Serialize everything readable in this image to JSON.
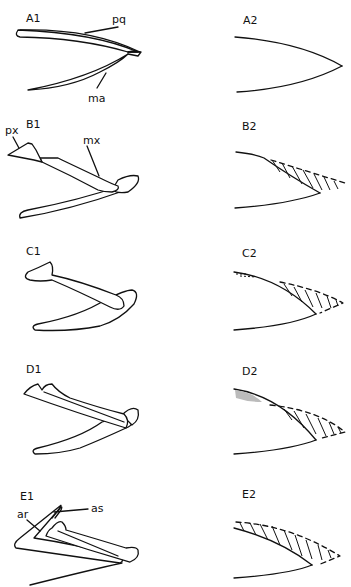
{
  "figure": {
    "panels": [
      {
        "id": "A1",
        "label": "A1",
        "annotations": [
          "pq",
          "ma"
        ]
      },
      {
        "id": "A2",
        "label": "A2",
        "annotations": []
      },
      {
        "id": "B1",
        "label": "B1",
        "annotations": [
          "px",
          "mx"
        ]
      },
      {
        "id": "B2",
        "label": "B2",
        "annotations": []
      },
      {
        "id": "C1",
        "label": "C1",
        "annotations": []
      },
      {
        "id": "C2",
        "label": "C2",
        "annotations": []
      },
      {
        "id": "D1",
        "label": "D1",
        "annotations": []
      },
      {
        "id": "D2",
        "label": "D2",
        "annotations": []
      },
      {
        "id": "E1",
        "label": "E1",
        "annotations": [
          "ar",
          "as"
        ]
      },
      {
        "id": "E2",
        "label": "E2",
        "annotations": []
      }
    ],
    "annotation_text": {
      "pq": "pq",
      "ma": "ma",
      "px": "px",
      "mx": "mx",
      "ar": "ar",
      "as": "as"
    },
    "colors": {
      "line": "#111111",
      "background": "#ffffff"
    }
  }
}
